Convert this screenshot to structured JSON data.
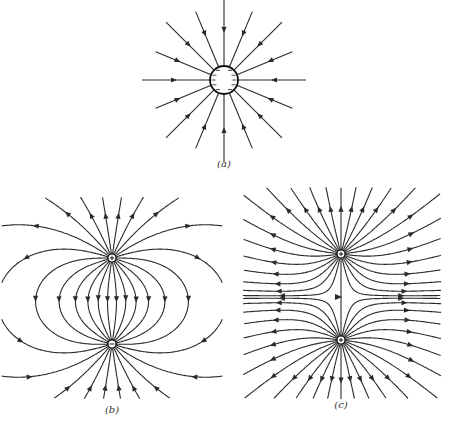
{
  "figure": {
    "panels": [
      {
        "id": "a",
        "label": "(a)",
        "description": "Isolated negatively charged sphere; radial field lines pointing inward",
        "charge_sign": "-",
        "center": [
          224,
          80
        ],
        "sphere_radius": 14,
        "line_count": 16,
        "line_length": 60,
        "arrow_direction": "inward"
      },
      {
        "id": "b",
        "label": "(b)",
        "description": "Electric dipole: positive charge above, negative charge below; field lines leave + and enter -",
        "charges": [
          {
            "sign": "+",
            "position": [
              112,
              258
            ]
          },
          {
            "sign": "-",
            "position": [
              112,
              344
            ]
          }
        ]
      },
      {
        "id": "c",
        "label": "(c)",
        "description": "Two equal positive charges; field lines repel outward with a neutral gap between",
        "charges": [
          {
            "sign": "+",
            "position": [
              341,
              254
            ]
          },
          {
            "sign": "+",
            "position": [
              341,
              340
            ]
          }
        ]
      }
    ],
    "colors": {
      "line": "#2a2a2a",
      "background": "#ffffff"
    }
  }
}
